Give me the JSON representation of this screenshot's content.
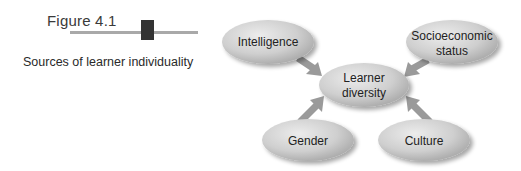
{
  "figure": {
    "number": "Figure 4.1",
    "caption": "Sources of learner individuality"
  },
  "diagram": {
    "center": {
      "label_line1": "Learner",
      "label_line2": "diversity"
    },
    "nodes": [
      {
        "id": "intelligence",
        "label_line1": "Intelligence",
        "label_line2": ""
      },
      {
        "id": "socioeconomic",
        "label_line1": "Socioeconomic",
        "label_line2": "status"
      },
      {
        "id": "gender",
        "label_line1": "Gender",
        "label_line2": ""
      },
      {
        "id": "culture",
        "label_line1": "Culture",
        "label_line2": ""
      }
    ],
    "colors": {
      "ellipse_light": "#e4e4e4",
      "ellipse_dark": "#a8a8a8",
      "arrow": "#9a9a9a",
      "accent_block": "#333333",
      "rule": "#a9a9a9"
    }
  }
}
